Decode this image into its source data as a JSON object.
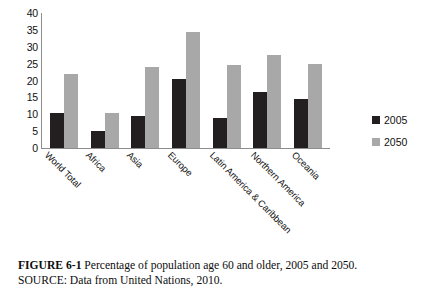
{
  "figure": {
    "caption_label": "FIGURE 6-1",
    "caption_text": "Percentage of population age 60 and older, 2005 and 2050.",
    "source_line": "SOURCE: Data from United Nations, 2010."
  },
  "legend": {
    "position": "right",
    "entries": [
      {
        "label": "2005",
        "color": "#231f20"
      },
      {
        "label": "2050",
        "color": "#a8a8a8"
      }
    ]
  },
  "axis": {
    "y_ticks": [
      "40",
      "35",
      "30",
      "25",
      "20",
      "15",
      "10",
      "5",
      "0"
    ]
  },
  "chart_data": {
    "type": "bar",
    "title": "",
    "xlabel": "",
    "ylabel": "",
    "ylim": [
      0,
      40
    ],
    "ytick_step": 5,
    "grid": false,
    "legend_position": "right",
    "categories": [
      "World Total",
      "Africa",
      "Asia",
      "Europe",
      "Latin America & Caribbean",
      "Northern America",
      "Oceania"
    ],
    "series": [
      {
        "name": "2005",
        "color": "#231f20",
        "values": [
          10.5,
          5,
          9.5,
          20.5,
          9,
          16.5,
          14.5
        ]
      },
      {
        "name": "2050",
        "color": "#a8a8a8",
        "values": [
          22,
          10.5,
          24,
          34.5,
          24.5,
          27.5,
          25
        ]
      }
    ]
  }
}
